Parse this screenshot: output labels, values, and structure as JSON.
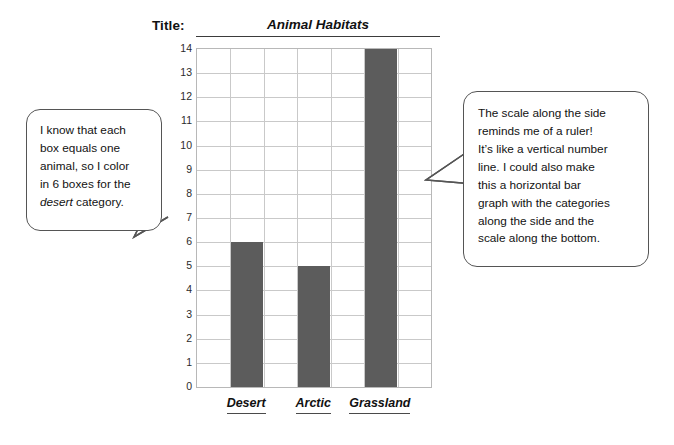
{
  "title_row": {
    "label": "Title:",
    "value": "Animal Habitats"
  },
  "chart_data": {
    "type": "bar",
    "title": "Animal Habitats",
    "categories": [
      "Desert",
      "Arctic",
      "Grassland"
    ],
    "values": [
      6,
      5,
      14
    ],
    "xlabel": "",
    "ylabel": "",
    "ylim": [
      0,
      14
    ],
    "ytick_labels": [
      "14",
      "13",
      "12",
      "11",
      "10",
      "9",
      "8",
      "7",
      "6",
      "5",
      "4",
      "3",
      "2",
      "1",
      "0"
    ],
    "grid": true,
    "grid_columns": 7,
    "bar_columns": [
      2,
      4,
      6
    ],
    "legend": "none",
    "bar_color": "#5c5c5c",
    "grid_color": "#c9c9c9",
    "axis_color": "#b8b8b8"
  },
  "annotations": {
    "left_bubble": {
      "line1": "I know that each",
      "line2": "box equals one",
      "line3": "animal, so I color",
      "line4": "in 6 boxes for the",
      "line5_italic": "desert",
      "line5_rest": " category."
    },
    "right_bubble": {
      "line1": "The scale along the side",
      "line2": "reminds me of a ruler!",
      "line3": "It’s like a vertical number",
      "line4": "line.  I could also make",
      "line5": "this a horizontal bar",
      "line6": "graph with the categories",
      "line7": "along the side and the",
      "line8": "scale along the bottom."
    }
  }
}
